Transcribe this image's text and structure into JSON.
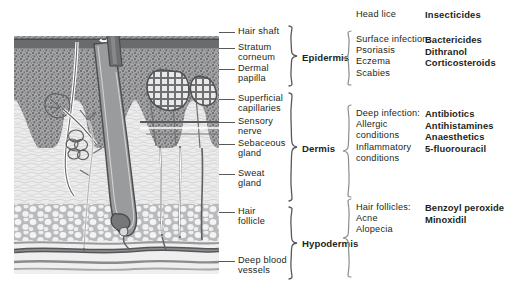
{
  "figure": {
    "accent_color": "#231f20",
    "line_color": "#58595b",
    "background": "#ffffff"
  },
  "headers": {
    "condition_header": "Head lice",
    "treatment_header": "Insecticides"
  },
  "structure_labels": [
    {
      "id": "hair-shaft",
      "text": "Hair shaft"
    },
    {
      "id": "stratum-corneum",
      "text": "Stratum\ncorneum"
    },
    {
      "id": "dermal-papilla",
      "text": "Dermal\npapilla"
    },
    {
      "id": "superficial-capillaries",
      "text": "Superficial\ncapillaries"
    },
    {
      "id": "sensory-nerve",
      "text": "Sensory\nnerve"
    },
    {
      "id": "sebaceous-gland",
      "text": "Sebaceous\ngland"
    },
    {
      "id": "sweat-gland",
      "text": "Sweat\ngland"
    },
    {
      "id": "hair-follicle",
      "text": "Hair\nfollicle"
    },
    {
      "id": "deep-blood-vessels",
      "text": "Deep blood\nvessels"
    }
  ],
  "layers": [
    {
      "id": "epidermis",
      "name": "Epidermis"
    },
    {
      "id": "dermis",
      "name": "Dermis"
    },
    {
      "id": "hypodermis",
      "name": "Hypodermis"
    }
  ],
  "treatment_groups": [
    {
      "id": "epidermis-group",
      "conditions": "Surface infection:\nPsoriasis\nEczema\nScabies",
      "drugs": "Bactericides\nDithranol\nCorticosteroids"
    },
    {
      "id": "dermis-group",
      "conditions": "Deep infection:\nAllergic\nconditions\nInflammatory\nconditions",
      "drugs": "Antibiotics\nAntihistamines\nAnaesthetics\n5-fluorouracil"
    },
    {
      "id": "follicle-group",
      "conditions": "Hair follicles:\nAcne\nAlopecia",
      "drugs": "Benzoyl peroxide\nMinoxidil"
    }
  ]
}
